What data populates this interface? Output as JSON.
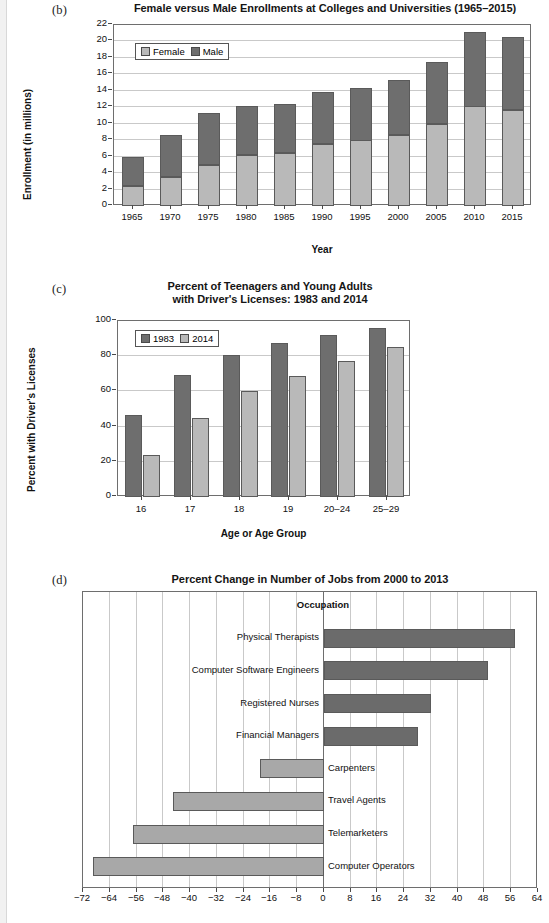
{
  "panels": {
    "b": {
      "letter": "(b)",
      "title": "Female versus Male Enrollments at Colleges and Universities (1965–2015)"
    },
    "c": {
      "letter": "(c)",
      "title_line1": "Percent of Teenagers and Young Adults",
      "title_line2": "with Driver's Licenses: 1983 and 2014"
    },
    "d": {
      "letter": "(d)",
      "title": "Percent Change in Number of Jobs from 2000 to 2013"
    }
  },
  "colors": {
    "female": "#b9b9b9",
    "male": "#6e6e6e",
    "y1983": "#6e6e6e",
    "y2014": "#b9b9b9",
    "positive": "#6b6b6b",
    "negative": "#a8a8a8",
    "grid": "#c9c9c9",
    "axis": "#6e6e6e"
  },
  "chart_data": [
    {
      "id": "enrollments",
      "type": "bar",
      "stacked": true,
      "title": "Female versus Male Enrollments at Colleges and Universities (1965–2015)",
      "xlabel": "Year",
      "ylabel": "Enrollment (in millions)",
      "ylim": [
        0,
        22
      ],
      "yticks": [
        0,
        2,
        4,
        6,
        8,
        10,
        12,
        14,
        16,
        18,
        20,
        22
      ],
      "ytick_labels": [
        "0",
        "2",
        "4",
        "6",
        "8",
        "10",
        "12",
        "14",
        "16",
        "18",
        "20",
        "22"
      ],
      "grid": true,
      "legend_position": "upper-left",
      "categories": [
        "1965",
        "1970",
        "1975",
        "1980",
        "1985",
        "1990",
        "1995",
        "2000",
        "2005",
        "2010",
        "2015"
      ],
      "series": [
        {
          "name": "Female",
          "values": [
            2.4,
            3.5,
            5.0,
            6.2,
            6.4,
            7.5,
            8.0,
            8.6,
            10.0,
            12.1,
            11.7
          ]
        },
        {
          "name": "Male",
          "values": [
            3.5,
            5.1,
            6.3,
            6.0,
            6.0,
            6.3,
            6.4,
            6.7,
            7.5,
            9.1,
            8.9
          ]
        }
      ],
      "totals": [
        5.9,
        8.6,
        11.3,
        12.2,
        12.4,
        13.8,
        14.4,
        15.3,
        17.5,
        21.2,
        20.6
      ]
    },
    {
      "id": "drivers-licenses",
      "type": "bar",
      "stacked": false,
      "title": "Percent of Teenagers and Young Adults with Driver's Licenses: 1983 and 2014",
      "xlabel": "Age or Age Group",
      "ylabel": "Percent with Driver's Licenses",
      "ylim": [
        0,
        100
      ],
      "yticks": [
        0,
        20,
        40,
        60,
        80,
        100
      ],
      "ytick_labels": [
        "0",
        "20",
        "40",
        "60",
        "80",
        "100"
      ],
      "grid": true,
      "legend_position": "upper-left",
      "categories": [
        "16",
        "17",
        "18",
        "19",
        "20–24",
        "25–29"
      ],
      "series": [
        {
          "name": "1983",
          "values": [
            46.5,
            69.5,
            80.5,
            87.5,
            92.0,
            96.0
          ]
        },
        {
          "name": "2014",
          "values": [
            24.0,
            45.0,
            60.0,
            69.0,
            77.5,
            85.5
          ]
        }
      ]
    },
    {
      "id": "job-change",
      "type": "bar",
      "orientation": "horizontal",
      "title": "Percent Change in Number of Jobs from 2000 to 2013",
      "xlabel": "",
      "ylabel": "Occupation",
      "xlim": [
        -72,
        64
      ],
      "xticks": [
        -72,
        -64,
        -56,
        -48,
        -40,
        -32,
        -24,
        -16,
        -8,
        0,
        8,
        16,
        24,
        32,
        40,
        48,
        56,
        64
      ],
      "xtick_labels": [
        "−72",
        "−64",
        "−56",
        "−48",
        "−40",
        "−32",
        "−24",
        "−16",
        "−8",
        "0",
        "8",
        "16",
        "24",
        "32",
        "40",
        "48",
        "56",
        "64"
      ],
      "grid": true,
      "categories": [
        "Physical Therapists",
        "Computer Software Engineers",
        "Registered Nurses",
        "Financial Managers",
        "Carpenters",
        "Travel Agents",
        "Telemarketers",
        "Computer Operators"
      ],
      "values": [
        57,
        49,
        32,
        28,
        -19,
        -45,
        -57,
        -69
      ]
    }
  ]
}
